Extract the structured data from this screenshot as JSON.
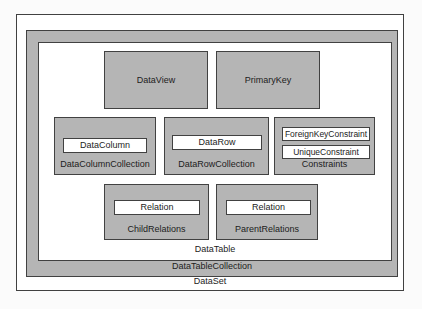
{
  "colors": {
    "container_fill_gray": "#b5b5b5",
    "leaf_fill_white": "#ffffff",
    "border": "#414141",
    "page_background": "#fbfbfb"
  },
  "nodes": {
    "dataset": "DataSet",
    "data_table_collection": "DataTableCollection",
    "data_table": "DataTable",
    "data_view": "DataView",
    "primary_key": "PrimaryKey",
    "data_column": "DataColumn",
    "data_column_collection": "DataColumnCollection",
    "data_row": "DataRow",
    "data_row_collection": "DataRowCollection",
    "foreign_key_constraint": "ForeignKeyConstraint",
    "unique_constraint": "UniqueConstraint",
    "constraints": "Constraints",
    "child_relation": "Relation",
    "child_relations": "ChildRelations",
    "parent_relation": "Relation",
    "parent_relations": "ParentRelations"
  }
}
